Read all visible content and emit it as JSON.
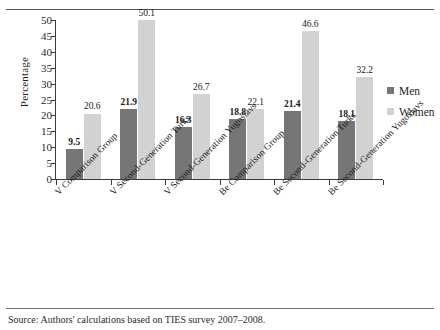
{
  "rules": {
    "top": "divider",
    "bottom": "divider"
  },
  "legend": {
    "position": "right",
    "items": [
      {
        "label": "Men",
        "color": "#767676"
      },
      {
        "label": "Women",
        "color": "#d2d2d2"
      }
    ]
  },
  "source_note": "Source: Authors' calculations based on TIES survey 2007–2008.",
  "chart_data": {
    "type": "bar",
    "title": "",
    "xlabel": "",
    "ylabel": "Percentage",
    "ylim": [
      0,
      50
    ],
    "yticks": [
      0,
      5,
      10,
      15,
      20,
      25,
      30,
      35,
      40,
      45,
      50
    ],
    "grid": false,
    "legend_position": "right",
    "categories": [
      "V Comparison Group",
      "V Second-Generation Turks",
      "V Second-Generation Yugoslavs",
      "Be Comparison Group",
      "Be Second-Generation Turks",
      "Be Second-Generation Yugoslavs"
    ],
    "series": [
      {
        "name": "Men",
        "color": "#767676",
        "values": [
          9.5,
          21.9,
          16.3,
          18.8,
          21.4,
          18.1
        ]
      },
      {
        "name": "Women",
        "color": "#d2d2d2",
        "values": [
          20.6,
          50.1,
          26.7,
          22.1,
          46.6,
          32.2
        ]
      }
    ]
  }
}
